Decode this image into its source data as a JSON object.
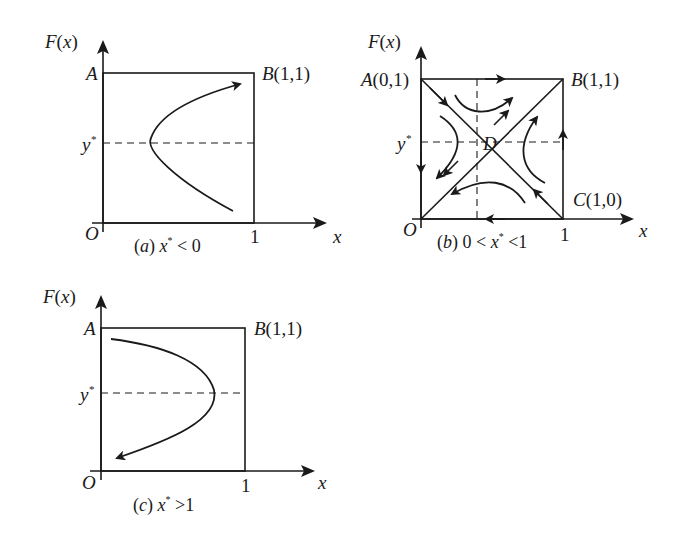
{
  "figure": {
    "panels": [
      {
        "id": "a",
        "y_axis_label": "F(x)",
        "x_axis_label": "x",
        "origin_label": "O",
        "corner_top_left": "A",
        "corner_top_right": "B(1,1)",
        "x_tick": "1",
        "y_star_label": "y*",
        "caption_prefix": "(a)",
        "caption_condition": "x* < 0",
        "trajectory": "parabola opening right, vertex on y*, arrow at upper end pointing toward B"
      },
      {
        "id": "b",
        "y_axis_label": "F(x)",
        "x_axis_label": "x",
        "origin_label": "O",
        "corner_top_left": "A(0,1)",
        "corner_top_right": "B(1,1)",
        "corner_bottom_right": "C(1,0)",
        "center_label": "D",
        "x_tick": "1",
        "y_star_label": "y*",
        "caption_prefix": "(b)",
        "caption_condition": "0 < x* < 1",
        "trajectory": "saddle point D with diagonals; stable manifold A-C, unstable manifold toward O and B"
      },
      {
        "id": "c",
        "y_axis_label": "F(x)",
        "x_axis_label": "x",
        "origin_label": "O",
        "corner_top_left": "A",
        "corner_top_right": "B(1,1)",
        "x_tick": "1",
        "y_star_label": "y*",
        "caption_prefix": "(c)",
        "caption_condition": "x* > 1",
        "trajectory": "parabola opening left, vertex on y*, arrow at lower end pointing toward O"
      }
    ]
  }
}
